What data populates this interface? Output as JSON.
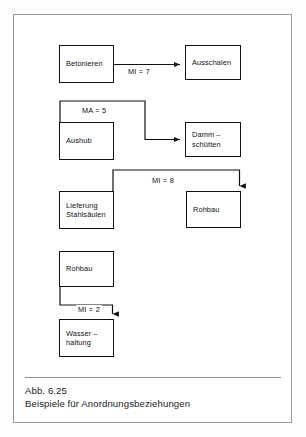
{
  "figure": {
    "caption_id": "Abb. 6.25",
    "caption_text": "Beispiele für Anordnungsbeziehungen",
    "frame_color": "#9a9a9a",
    "line_color": "#111111",
    "background": "#ffffff"
  },
  "diagram": {
    "type": "precedence-network",
    "nodes": [
      {
        "id": "betonieren",
        "label": "Betonieren",
        "x": 45,
        "y": 30,
        "w": 55,
        "h": 38
      },
      {
        "id": "ausschalen",
        "label": "Ausschalen",
        "x": 171,
        "y": 30,
        "w": 56,
        "h": 35
      },
      {
        "id": "aushub",
        "label": "Aushub",
        "x": 45,
        "y": 107,
        "w": 55,
        "h": 38
      },
      {
        "id": "damm",
        "label": "Damm  –\nschütten",
        "x": 171,
        "y": 107,
        "w": 56,
        "h": 35
      },
      {
        "id": "lieferung",
        "label": "Lieferung\nStahlsäulen",
        "x": 45,
        "y": 176,
        "w": 55,
        "h": 38
      },
      {
        "id": "rohbau-1",
        "label": "Rohbau",
        "x": 172,
        "y": 176,
        "w": 55,
        "h": 37
      },
      {
        "id": "rohbau-2",
        "label": "Rohbau",
        "x": 45,
        "y": 236,
        "w": 55,
        "h": 36
      },
      {
        "id": "wasserhaltung",
        "label": "Wasser  –\nhaltung",
        "x": 45,
        "y": 304,
        "w": 55,
        "h": 38
      }
    ],
    "edges": [
      {
        "id": "edge-1",
        "from": "betonieren",
        "to": "ausschalen",
        "label": "MI = 7",
        "label_x": 112,
        "label_y": 52
      },
      {
        "id": "edge-2",
        "from": "aushub",
        "to": "damm",
        "label": "MA = 5",
        "label_x": 66,
        "label_y": 91
      },
      {
        "id": "edge-3",
        "from": "lieferung",
        "to": "rohbau-1",
        "label": "MI = 8",
        "label_x": 136,
        "label_y": 161
      },
      {
        "id": "edge-4",
        "from": "rohbau-2",
        "to": "wasserhaltung",
        "label": "MI = 2",
        "label_x": 62,
        "label_y": 290
      }
    ]
  }
}
